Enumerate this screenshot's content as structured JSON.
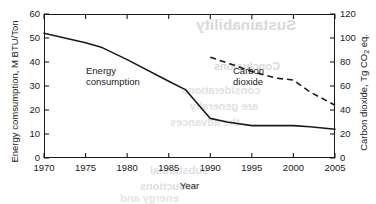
{
  "figure": {
    "background_color": "#ffffff",
    "ink_color": "#1a1a1a",
    "bleed_through": {
      "note": "faint mirrored text bleeding through from the reverse page of the scan",
      "title": "Sustainability",
      "subtitle": "Conclusions",
      "line1": "considerations",
      "line2": "are generally",
      "line3": "the advances",
      "line4": "substantial",
      "line5": "reductions",
      "line6": "energy and"
    }
  },
  "chart_data": {
    "type": "line",
    "title": "",
    "xlabel": "Year",
    "ylabel": "Energy comsumption, M BTU/Ton",
    "y2label": "Carbon dioxide, Tg CO2 eq.",
    "xlim": [
      1970,
      2005
    ],
    "ylim": [
      0,
      60
    ],
    "y2lim": [
      0,
      120
    ],
    "xticks": [
      1970,
      1975,
      1980,
      1985,
      1990,
      1995,
      2000,
      2005
    ],
    "yticks": [
      0,
      10,
      20,
      30,
      40,
      50,
      60
    ],
    "y2ticks": [
      0,
      20,
      40,
      60,
      80,
      100,
      120
    ],
    "grid": false,
    "legend": "in-plot annotations",
    "series": [
      {
        "name": "Energy consumption",
        "axis": "left",
        "style": "solid",
        "color": "#1a1a1a",
        "x": [
          1970,
          1975,
          1977,
          1980,
          1985,
          1987,
          1990,
          1992,
          1995,
          1998,
          2000,
          2002,
          2005
        ],
        "values": [
          52.0,
          48.0,
          46.0,
          41.0,
          32.0,
          28.5,
          16.5,
          15.0,
          13.5,
          13.5,
          13.5,
          13.0,
          12.0
        ],
        "annotation": "Energy\nconsumption"
      },
      {
        "name": "Carbon dioxide",
        "axis": "right",
        "style": "dashed",
        "color": "#1a1a1a",
        "x": [
          1990,
          1993,
          1995,
          1998,
          2000,
          2002,
          2005
        ],
        "values": [
          84.0,
          77.0,
          72.0,
          66.5,
          65.0,
          55.0,
          44.0
        ],
        "annotation": "Carbon\ndioxide"
      }
    ],
    "annotations": [
      {
        "text_line1": "Energy",
        "text_line2": "consumption"
      },
      {
        "text_line1": "Carbon",
        "text_line2": "dioxide"
      }
    ],
    "xtick_labels": [
      "1970",
      "1975",
      "1980",
      "1985",
      "1990",
      "1995",
      "2000",
      "2005"
    ],
    "ytick_labels": [
      "0",
      "10",
      "20",
      "30",
      "40",
      "50",
      "60"
    ],
    "y2tick_labels": [
      "0",
      "20",
      "40",
      "60",
      "80",
      "100",
      "120"
    ]
  }
}
